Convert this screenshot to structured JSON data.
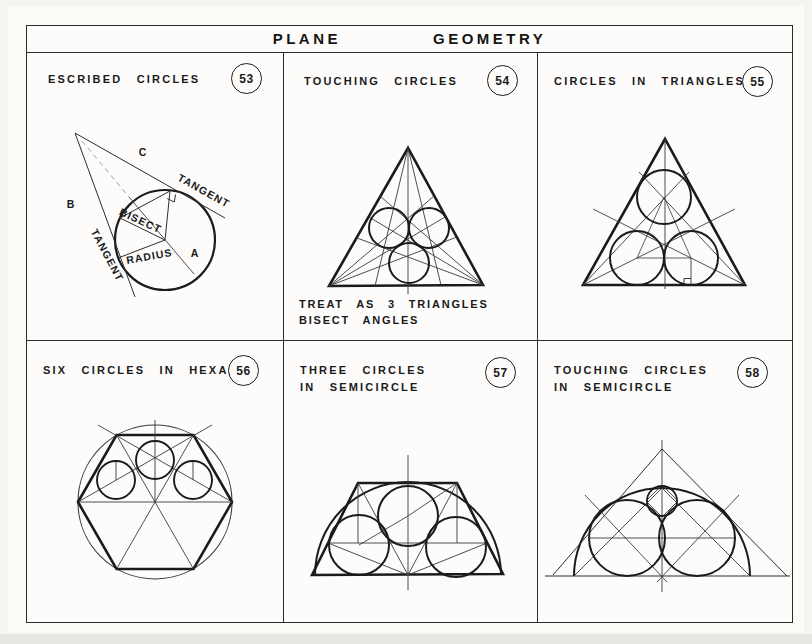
{
  "page": {
    "title_word1": "PLANE",
    "title_word2": "GEOMETRY"
  },
  "colors": {
    "ink": "#1c1c1c",
    "paper": "#fcfbf8"
  },
  "panels": {
    "p53": {
      "title": "ESCRIBED CIRCLES",
      "number": "53",
      "labels": {
        "c": "C",
        "b": "B",
        "a": "A",
        "tangent_upper": "TANGENT",
        "tangent_lower": "TANGENT",
        "bisect": "BISECT",
        "radius": "RADIUS"
      }
    },
    "p54": {
      "title": "TOUCHING CIRCLES",
      "number": "54",
      "caption_line1": "TREAT AS 3 TRIANGLES",
      "caption_line2": "BISECT ANGLES"
    },
    "p55": {
      "title": "CIRCLES IN TRIANGLES",
      "number": "55"
    },
    "p56": {
      "title": "SIX CIRCLES IN HEXAGON",
      "number": "56"
    },
    "p57": {
      "title_line1": "THREE CIRCLES",
      "title_line2": "IN SEMICIRCLE",
      "number": "57"
    },
    "p58": {
      "title_line1": "TOUCHING CIRCLES",
      "title_line2": "IN SEMICIRCLE",
      "number": "58"
    }
  }
}
